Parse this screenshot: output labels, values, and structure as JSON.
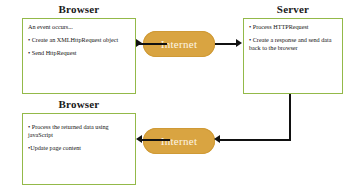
{
  "diagram": {
    "title_browser_top": "Browser",
    "title_server": "Server",
    "title_browser_bottom": "Browser",
    "internet_label_top": "Internet",
    "internet_label_bottom": "Internet",
    "colors": {
      "box_border": "#93b949",
      "pill_fill": "#d9a441",
      "pill_text": "#fdf6e6",
      "arrow": "#111111",
      "background": "#ffffff",
      "text": "#141414"
    },
    "browser_top_lines": [
      "An event occurs...",
      "• Create an XMLHttpRequest object",
      "• Send HttpRequest"
    ],
    "server_lines": [
      "• Process HTTPRequest",
      "• Create a response and send data back to the browser"
    ],
    "browser_bottom_lines": [
      "• Process the returned data using javaScript",
      "•Update page content"
    ]
  }
}
